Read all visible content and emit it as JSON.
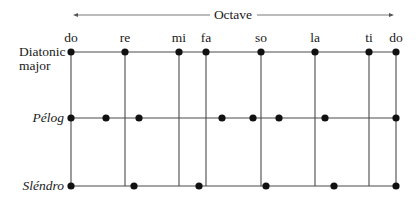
{
  "title": "Octave",
  "diagram": {
    "octave_arrow": {
      "x1": 73,
      "x2": 394,
      "y": 15,
      "label": "Octave",
      "label_x": 233
    },
    "degree_labels": [
      {
        "text": "do",
        "x": 71
      },
      {
        "text": "re",
        "x": 125
      },
      {
        "text": "mi",
        "x": 179
      },
      {
        "text": "fa",
        "x": 206
      },
      {
        "text": "so",
        "x": 261
      },
      {
        "text": "la",
        "x": 315
      },
      {
        "text": "ti",
        "x": 369
      },
      {
        "text": "do",
        "x": 396
      }
    ],
    "degree_label_y": 42,
    "rows": [
      {
        "name": "diatonic-major",
        "label_line1": "Diatonic",
        "label_line2": "major",
        "italic": false,
        "y": 52
      },
      {
        "name": "pelog",
        "label_line1": "Pélog",
        "italic": true,
        "y": 118
      },
      {
        "name": "slendro",
        "label_line1": "Sléndro",
        "italic": true,
        "y": 186
      }
    ],
    "verticals": [
      71,
      125,
      179,
      206,
      261,
      315,
      369,
      396
    ],
    "dots": {
      "diatonic-major": [
        71,
        125,
        179,
        206,
        261,
        315,
        369,
        396
      ],
      "pelog": [
        71,
        106,
        139,
        222,
        253,
        279,
        325,
        396
      ],
      "slendro": [
        71,
        134,
        199,
        266,
        334,
        396
      ]
    },
    "colors": {
      "line": "#4a4a4a",
      "dot": "#111111",
      "text": "#1a1a1a"
    }
  },
  "labels": {
    "octave": "Octave",
    "diatonic_line1": "Diatonic",
    "diatonic_line2": "major",
    "pelog": "Pélog",
    "slendro": "Sléndro",
    "deg0": "do",
    "deg1": "re",
    "deg2": "mi",
    "deg3": "fa",
    "deg4": "so",
    "deg5": "la",
    "deg6": "ti",
    "deg7": "do"
  }
}
